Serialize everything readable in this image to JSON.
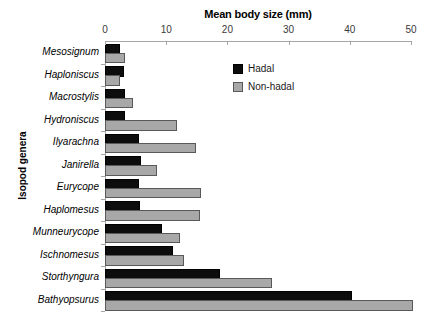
{
  "chart_data": {
    "type": "bar",
    "orientation": "horizontal",
    "title": "Mean body size (mm)",
    "xlabel": "Mean body size (mm)",
    "ylabel": "Isopod genera",
    "xlim": [
      0,
      50
    ],
    "xticks": [
      0,
      10,
      20,
      30,
      40,
      50
    ],
    "xtick_labels": [
      "0",
      "10",
      "20",
      "30",
      "40",
      "50"
    ],
    "grid": false,
    "legend_position": "upper right inside",
    "categories": [
      "Mesosignum",
      "Haploniscus",
      "Macrostylis",
      "Hydroniscus",
      "Ilyarachna",
      "Janirella",
      "Eurycope",
      "Haplomesus",
      "Munneurycope",
      "Ischnomesus",
      "Storthyngura",
      "Bathyopsurus"
    ],
    "series": [
      {
        "name": "Hadal",
        "color": "#0d0d0d",
        "values": [
          2.1,
          2.8,
          3.0,
          3.0,
          5.2,
          5.6,
          5.2,
          5.4,
          9.0,
          10.8,
          18.5,
          40.0
        ]
      },
      {
        "name": "Non-hadal",
        "color": "#a8a8a8",
        "values": [
          3.0,
          2.1,
          4.3,
          11.5,
          14.6,
          8.1,
          15.4,
          15.2,
          12.0,
          12.6,
          26.9,
          50.0
        ]
      }
    ]
  }
}
